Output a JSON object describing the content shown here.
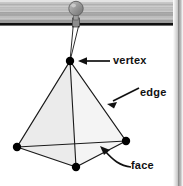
{
  "figure": {
    "background_color": "#ffffff",
    "labels": [
      {
        "id": "vertex",
        "text": "vertex",
        "pointer": "straight-arrow-left"
      },
      {
        "id": "edge",
        "text": "edge",
        "pointer": "diagonal-arrow-down-left"
      },
      {
        "id": "face",
        "text": "face",
        "pointer": "curved-arrow-up-left"
      }
    ],
    "solid": {
      "name": "tetrahedron",
      "face_fill": "#f0f0f0",
      "edge_color": "#1a1a1a",
      "vertex_color": "#000000",
      "vertex_radius": 4,
      "vertices": [
        {
          "name": "apex",
          "x": 70,
          "y": 61
        },
        {
          "name": "back-left",
          "x": 17,
          "y": 147
        },
        {
          "name": "front",
          "x": 76,
          "y": 167
        },
        {
          "name": "back-right",
          "x": 126,
          "y": 141
        }
      ]
    },
    "suspension": {
      "band_color_light": "#e8e8e8",
      "band_color_dark": "#8d8d8d",
      "band_rule_color": "#111111",
      "pin_color": "#9a9a9a",
      "pin_head": {
        "x": 76,
        "y": 8,
        "r": 7
      },
      "thread_color": "#333333"
    },
    "page_edge": {
      "shadow_color": "#b5b5b5",
      "width": 10
    }
  }
}
